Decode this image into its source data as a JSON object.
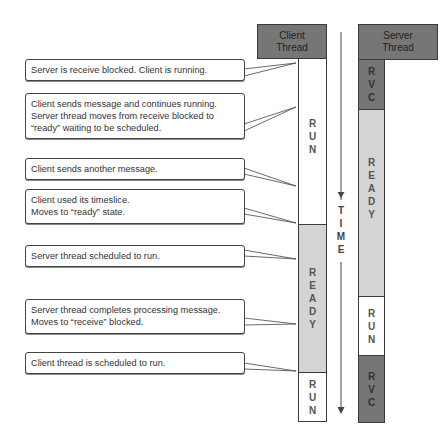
{
  "client": {
    "header": [
      "Client",
      "Thread"
    ],
    "segments": [
      {
        "state": "run",
        "label": [
          "R",
          "U",
          "N"
        ]
      },
      {
        "state": "ready",
        "label": [
          "R",
          "E",
          "A",
          "D",
          "Y"
        ]
      },
      {
        "state": "run",
        "label": [
          "R",
          "U",
          "N"
        ]
      }
    ]
  },
  "server": {
    "header": [
      "Server",
      "Thread"
    ],
    "segments": [
      {
        "state": "rvc",
        "label": [
          "R",
          "V",
          "C"
        ]
      },
      {
        "state": "ready",
        "label": [
          "R",
          "E",
          "A",
          "D",
          "Y"
        ]
      },
      {
        "state": "run",
        "label": [
          "R",
          "U",
          "N"
        ]
      },
      {
        "state": "rvc",
        "label": [
          "R",
          "V",
          "C"
        ]
      }
    ]
  },
  "time_axis": {
    "label": [
      "T",
      "I",
      "M",
      "E"
    ],
    "icon": "down-arrow-icon"
  },
  "callouts": [
    {
      "lines": [
        "Server is receive blocked. Client is running."
      ]
    },
    {
      "lines": [
        "Client sends message and continues running.",
        "Server thread moves from receive blocked to",
        "“ready” waiting to be scheduled."
      ]
    },
    {
      "lines": [
        "Client sends another message."
      ]
    },
    {
      "lines": [
        "Client used its timeslice.",
        "Moves to “ready” state."
      ]
    },
    {
      "lines": [
        "Server thread scheduled to run."
      ]
    },
    {
      "lines": [
        "Server thread completes processing message.",
        "Moves to “receive” blocked."
      ]
    },
    {
      "lines": [
        "Client thread is scheduled to run."
      ]
    }
  ],
  "colors": {
    "header": "#767676",
    "rvc": "#767676",
    "ready": "#d4d4d4",
    "run": "#ffffff",
    "border": "#3a3a3a"
  }
}
